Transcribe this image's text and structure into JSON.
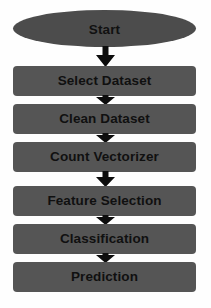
{
  "diagram": {
    "type": "flowchart",
    "orientation": "top-to-bottom",
    "background_color": "#fefefe",
    "node_fill_color": "#555555",
    "start_node_fill_color": "#4c4c4c",
    "text_color": "#101010",
    "arrow_color": "#0d0d0d",
    "nodes": [
      {
        "id": "start",
        "label": "Start",
        "shape": "ellipse"
      },
      {
        "id": "select-dataset",
        "label": "Select Dataset",
        "shape": "rectangle"
      },
      {
        "id": "clean-dataset",
        "label": "Clean Dataset",
        "shape": "rectangle"
      },
      {
        "id": "count-vectorizer",
        "label": "Count Vectorizer",
        "shape": "rectangle"
      },
      {
        "id": "feature-selection",
        "label": "Feature Selection",
        "shape": "rectangle"
      },
      {
        "id": "classification",
        "label": "Classification",
        "shape": "rectangle"
      },
      {
        "id": "prediction",
        "label": "Prediction",
        "shape": "rectangle"
      }
    ],
    "connectors": [
      {
        "from": "start",
        "to": "select-dataset",
        "icon": "down-block-arrow-icon"
      },
      {
        "from": "select-dataset",
        "to": "clean-dataset",
        "icon": "down-block-arrow-icon"
      },
      {
        "from": "clean-dataset",
        "to": "count-vectorizer",
        "icon": "down-block-arrow-icon"
      },
      {
        "from": "count-vectorizer",
        "to": "feature-selection",
        "icon": "down-block-arrow-icon"
      },
      {
        "from": "feature-selection",
        "to": "classification",
        "icon": "down-block-arrow-icon"
      },
      {
        "from": "classification",
        "to": "prediction",
        "icon": "down-block-arrow-icon"
      }
    ]
  }
}
